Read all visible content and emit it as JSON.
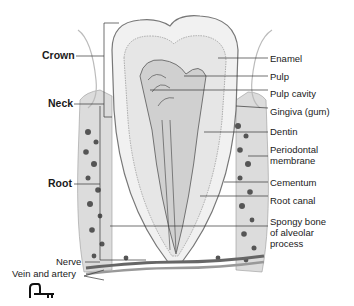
{
  "diagram": {
    "left_labels": [
      {
        "id": "crown",
        "text": "Crown"
      },
      {
        "id": "neck",
        "text": "Neck"
      },
      {
        "id": "root",
        "text": "Root"
      },
      {
        "id": "nerve",
        "text": "Nerve"
      },
      {
        "id": "vein",
        "text": "Vein and artery"
      }
    ],
    "right_labels": [
      {
        "id": "enamel",
        "text": "Enamel"
      },
      {
        "id": "pulp",
        "text": "Pulp"
      },
      {
        "id": "pulp_cavity",
        "text": "Pulp cavity"
      },
      {
        "id": "gingiva",
        "text": "Gingiva (gum)"
      },
      {
        "id": "dentin",
        "text": "Dentin"
      },
      {
        "id": "periodontal_1",
        "text": "Periodontal"
      },
      {
        "id": "periodontal_2",
        "text": "membrane"
      },
      {
        "id": "cementum",
        "text": "Cementum"
      },
      {
        "id": "root_canal",
        "text": "Root canal"
      },
      {
        "id": "spongy_1",
        "text": "Spongy bone"
      },
      {
        "id": "spongy_2",
        "text": "of alveolar"
      },
      {
        "id": "spongy_3",
        "text": "process"
      }
    ],
    "icon": "key-icon"
  }
}
